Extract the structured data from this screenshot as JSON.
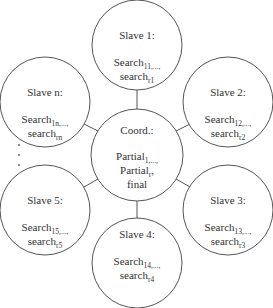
{
  "diagram": {
    "colors": {
      "stroke": "#555555",
      "text": "#333333",
      "background": "#ffffff"
    },
    "center": {
      "title": "Coord.:",
      "line1_main": "Partial",
      "line1_sub": "1,...,",
      "line2_main": "Partial",
      "line2_sub": "r",
      "line2_suffix": ",",
      "line3": "final"
    },
    "nodes": [
      {
        "title": "Slave 1:",
        "search_main": "Search",
        "search_sub": "11",
        "search_tail": ",...,",
        "search2_main": "search",
        "search2_sub": "r1"
      },
      {
        "title": "Slave 2:",
        "search_main": "Search",
        "search_sub": "12",
        "search_tail": ",...,",
        "search2_main": "search",
        "search2_sub": "r2"
      },
      {
        "title": "Slave 3:",
        "search_main": "Search",
        "search_sub": "13",
        "search_tail": ",...,",
        "search2_main": "search",
        "search2_sub": "r3"
      },
      {
        "title": "Slave 4:",
        "search_main": "Search",
        "search_sub": "14",
        "search_tail": ",...,",
        "search2_main": "search",
        "search2_sub": "r4"
      },
      {
        "title": "Slave 5:",
        "search_main": "Search",
        "search_sub": "15",
        "search_tail": ",...,",
        "search2_main": "search",
        "search2_sub": "r5"
      },
      {
        "title": "Slave n:",
        "search_main": "Search",
        "search_sub": "1n",
        "search_tail": ",...,",
        "search2_main": "search",
        "search2_sub": "rn"
      }
    ],
    "ellipsis": "⋮"
  }
}
